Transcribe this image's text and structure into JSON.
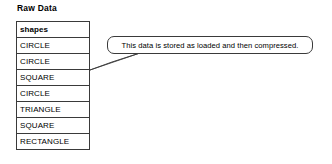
{
  "diagram": {
    "title": "Raw Data",
    "table": {
      "column_header": "shapes",
      "rows": [
        "CIRCLE",
        "CIRCLE",
        "SQUARE",
        "CIRCLE",
        "TRIANGLE",
        "SQUARE",
        "RECTANGLE"
      ]
    },
    "callout": {
      "text": "This data is stored as loaded and then compressed."
    },
    "colors": {
      "background": "#ffffff",
      "line": "#3a3a3a",
      "text": "#000000"
    }
  }
}
